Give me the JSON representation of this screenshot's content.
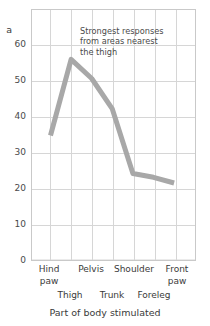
{
  "chart_data": {
    "type": "line",
    "title": "",
    "xlabel": "Part of body stimulated",
    "ylabel": "a",
    "categories": [
      "Hind paw",
      "Thigh",
      "Pelvis",
      "Trunk",
      "Shoulder",
      "Foreleg",
      "Front paw"
    ],
    "values": [
      33,
      53,
      48,
      40,
      23,
      22,
      20.5
    ],
    "series": [
      {
        "name": "Response",
        "values": [
          33,
          53,
          48,
          40,
          23,
          22,
          20.5
        ]
      }
    ],
    "ylim": [
      0,
      66
    ],
    "yticks": [
      0,
      10,
      20,
      30,
      40,
      50,
      60
    ],
    "ytick_labels": [
      "0",
      "10",
      "20",
      "30",
      "40",
      "50",
      "60"
    ],
    "grid": true,
    "legend": "none",
    "line_color": "#a8a8a8",
    "grid_color": "#d3d3d3",
    "frame_color": "#c9c9c9",
    "annotations": [
      {
        "name": "peak-callout",
        "lines": [
          "Strongest responses",
          "from areas nearest",
          "the thigh"
        ]
      }
    ]
  },
  "axis": {
    "y_title_clipped": "a",
    "y_ticks": [
      "60",
      "50",
      "40",
      "30",
      "20",
      "10",
      "0"
    ],
    "x_title": "Part of body stimulated",
    "x_labels_upper": [
      {
        "line1": "Hind",
        "line2": "paw"
      },
      {
        "line1": "Pelvis",
        "line2": ""
      },
      {
        "line1": "Shoulder",
        "line2": ""
      },
      {
        "line1": "Front",
        "line2": "paw"
      }
    ],
    "x_labels_lower": [
      "Thigh",
      "Trunk",
      "Foreleg"
    ]
  },
  "annotation": {
    "line1": "Strongest responses",
    "line2": "from areas nearest",
    "line3": "the thigh"
  }
}
